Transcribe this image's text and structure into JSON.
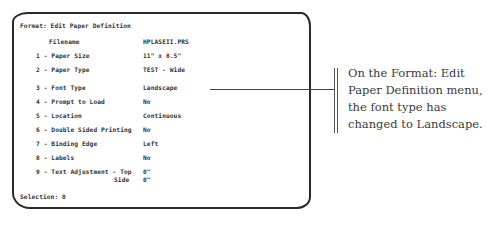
{
  "screen": {
    "title": "Format: Edit Paper Definition",
    "filename_label": "Filename",
    "filename_value": "HPLASEII.PRS",
    "options": [
      {
        "label": "1 - Paper Size",
        "value": "11\" x 8.5\""
      },
      {
        "label": "2 - Paper Type",
        "value": "TEST - Wide"
      },
      {
        "label": "3 - Font Type",
        "value": "Landscape"
      },
      {
        "label": "4 - Prompt to Load",
        "value": "No"
      },
      {
        "label": "5 - Location",
        "value": "Continuous"
      },
      {
        "label": "6 - Double Sided Printing",
        "value": "No"
      },
      {
        "label": "7 - Binding Edge",
        "value": "Left"
      },
      {
        "label": "8 - Labels",
        "value": "No"
      },
      {
        "label": "9 - Text Adjustment - Top",
        "value": "0\""
      }
    ],
    "text_adjust_side_label": "Side",
    "text_adjust_side_value": "0\"",
    "selection_prompt": "Selection: 0"
  },
  "callout": {
    "text": "On the Format: Edit Paper Definition menu, the font type has changed to Landscape."
  }
}
